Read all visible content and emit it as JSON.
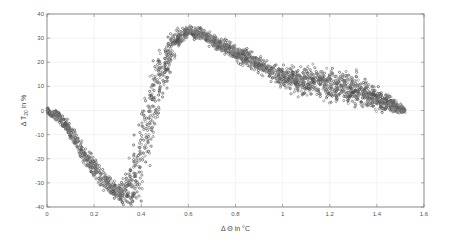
{
  "chart_data": {
    "type": "scatter",
    "title": "",
    "xlabel": "Δ Θ in °C",
    "ylabel": "Δ T_20 in %",
    "ylabel_main": "Δ T",
    "ylabel_sub": "20",
    "ylabel_tail": " in %",
    "xlim": [
      0,
      1.6
    ],
    "ylim": [
      -40,
      40
    ],
    "xticks": [
      0,
      0.2,
      0.4,
      0.6,
      0.8,
      1,
      1.2,
      1.4,
      1.6
    ],
    "xtick_labels": [
      "0",
      "0.2",
      "0.4",
      "0.6",
      "0.8",
      "1",
      "1.2",
      "1.4",
      "1.6"
    ],
    "yticks": [
      -40,
      -30,
      -20,
      -10,
      0,
      10,
      20,
      30,
      40
    ],
    "ytick_labels": [
      "-40",
      "-30",
      "-20",
      "-10",
      "0",
      "10",
      "20",
      "30",
      "40"
    ],
    "grid": true,
    "legend": null,
    "marker_color": "#555555",
    "series": [
      {
        "name": "measurements",
        "description": "Dense scatter: starts at 0, dips to ~-35 near x=0.33, rises to peak ~33 near x=0.6, declines with a spread band (5 to 18) between x=1.0 and 1.4, ends ~0 at x=1.52",
        "centerline": [
          [
            0.0,
            0
          ],
          [
            0.05,
            -3
          ],
          [
            0.1,
            -9
          ],
          [
            0.15,
            -17
          ],
          [
            0.2,
            -24
          ],
          [
            0.25,
            -30
          ],
          [
            0.3,
            -34
          ],
          [
            0.33,
            -35
          ],
          [
            0.37,
            -30
          ],
          [
            0.4,
            -18
          ],
          [
            0.43,
            -5
          ],
          [
            0.46,
            7
          ],
          [
            0.5,
            20
          ],
          [
            0.55,
            30
          ],
          [
            0.6,
            33
          ],
          [
            0.65,
            32
          ],
          [
            0.7,
            29
          ],
          [
            0.8,
            24
          ],
          [
            0.9,
            19
          ],
          [
            1.0,
            14
          ],
          [
            1.1,
            12
          ],
          [
            1.2,
            11
          ],
          [
            1.3,
            9
          ],
          [
            1.4,
            5
          ],
          [
            1.47,
            2
          ],
          [
            1.52,
            0
          ]
        ],
        "spread": [
          [
            0.0,
            1
          ],
          [
            0.1,
            3
          ],
          [
            0.2,
            4
          ],
          [
            0.3,
            3
          ],
          [
            0.35,
            6
          ],
          [
            0.4,
            9
          ],
          [
            0.45,
            9
          ],
          [
            0.5,
            7
          ],
          [
            0.55,
            4
          ],
          [
            0.6,
            2
          ],
          [
            0.7,
            2.5
          ],
          [
            0.9,
            3
          ],
          [
            1.0,
            4
          ],
          [
            1.1,
            5
          ],
          [
            1.2,
            6
          ],
          [
            1.3,
            6
          ],
          [
            1.4,
            4
          ],
          [
            1.52,
            1
          ]
        ]
      }
    ]
  }
}
